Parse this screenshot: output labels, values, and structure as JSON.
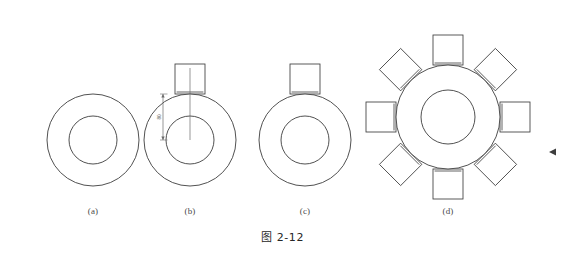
{
  "document": {
    "caption": "图 2-12",
    "background_color": "#ffffff",
    "line_color": "#3d3d3d",
    "page_width": 565,
    "page_height": 262
  },
  "subfigures": [
    {
      "label": "(a)",
      "label_x": 73,
      "label_y": 206,
      "center_x": 93,
      "center_y": 140,
      "outer_radius": 46,
      "inner_radius": 24,
      "square_count": 0,
      "square_size": 0,
      "square_angles": [],
      "has_dimension": false
    },
    {
      "label": "(b)",
      "label_x": 170,
      "label_y": 206,
      "center_x": 190,
      "center_y": 140,
      "outer_radius": 46,
      "inner_radius": 24,
      "square_count": 1,
      "square_size": 30,
      "square_angles": [
        270
      ],
      "has_dimension": true,
      "dimension_label": "80",
      "dimension_x": 163,
      "dimension_top": 94,
      "dimension_bottom": 140
    },
    {
      "label": "(c)",
      "label_x": 285,
      "label_y": 206,
      "center_x": 305,
      "center_y": 140,
      "outer_radius": 46,
      "inner_radius": 24,
      "square_count": 1,
      "square_size": 30,
      "square_angles": [
        270
      ],
      "has_dimension": false
    },
    {
      "label": "(d)",
      "label_x": 428,
      "label_y": 206,
      "center_x": 448,
      "center_y": 117,
      "outer_radius": 52,
      "inner_radius": 27,
      "square_count": 8,
      "square_size": 30,
      "square_angles": [
        270,
        315,
        0,
        45,
        90,
        135,
        180,
        225
      ],
      "has_dimension": false
    }
  ],
  "edge_marker": {
    "name": "left-pointing-triangle",
    "x": 556,
    "y": 152,
    "size": 7,
    "color": "#3d3d3d"
  }
}
